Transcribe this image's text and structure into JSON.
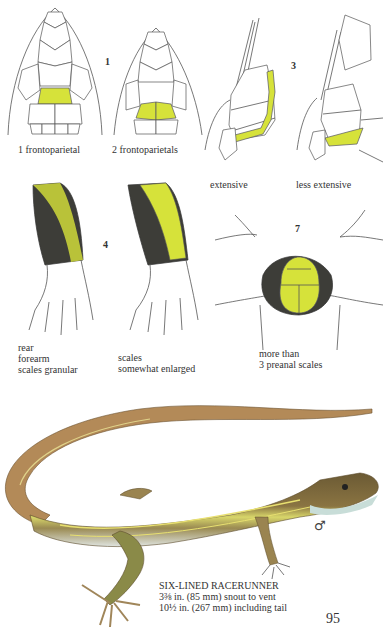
{
  "page": {
    "page_number": "95",
    "highlight_color": "#d6e23a"
  },
  "figures": {
    "fig1": {
      "number": "1",
      "left_caption": "1 frontoparietal",
      "right_caption": "2 frontoparietals"
    },
    "fig3": {
      "number": "3",
      "left_caption": "extensive",
      "right_caption": "less extensive"
    },
    "fig4": {
      "number": "4",
      "left_caption_lines": [
        "rear",
        "forearm",
        "scales granular"
      ],
      "right_caption_lines": [
        "scales",
        "somewhat enlarged"
      ]
    },
    "fig7": {
      "number": "7",
      "caption_lines": [
        "more than",
        "3 preanal scales"
      ]
    }
  },
  "species": {
    "name": "SIX-LINED RACERUNNER",
    "size_line1": "3⅜ in. (85 mm) snout to vent",
    "size_line2": "10½ in. (267 mm) including tail",
    "sex_symbol": "♂"
  }
}
